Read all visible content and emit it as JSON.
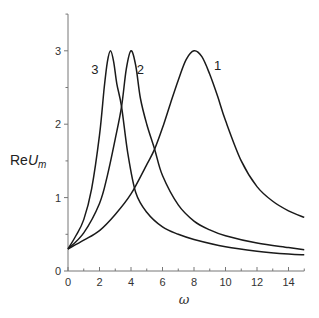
{
  "chart_data": {
    "type": "line",
    "title": "",
    "xlabel": "ω",
    "ylabel": "ReU_m",
    "ylabel_parts": {
      "re": "Re",
      "u": "U",
      "sub": "m"
    },
    "xlim": [
      0,
      15
    ],
    "ylim": [
      0,
      3.5
    ],
    "xticks": [
      0,
      2,
      4,
      6,
      8,
      10,
      12,
      14
    ],
    "xticks_minor": [
      1,
      3,
      5,
      7,
      9,
      11,
      13,
      15
    ],
    "yticks": [
      0,
      1,
      2,
      3
    ],
    "yticks_minor": [
      0.5,
      1.5,
      2.5,
      3.5
    ],
    "grid": false,
    "legend": "none (curves labeled inline)",
    "series": [
      {
        "name": "1",
        "label_pos": [
          9.5,
          2.8
        ],
        "x": [
          0,
          1,
          2,
          3,
          4,
          5,
          5.5,
          6,
          6.5,
          7,
          7.5,
          8,
          8.5,
          9,
          9.5,
          10,
          11,
          12,
          13,
          14,
          15
        ],
        "y": [
          0.3,
          0.42,
          0.55,
          0.77,
          1.05,
          1.45,
          1.66,
          1.95,
          2.28,
          2.6,
          2.88,
          3.0,
          2.92,
          2.68,
          2.38,
          2.05,
          1.5,
          1.15,
          0.95,
          0.82,
          0.73
        ]
      },
      {
        "name": "2",
        "label_pos": [
          4.6,
          2.75
        ],
        "x": [
          0,
          1,
          2,
          2.5,
          3,
          3.4,
          3.7,
          4,
          4.3,
          4.6,
          5,
          5.5,
          6,
          7,
          8,
          9,
          10,
          12,
          14,
          15
        ],
        "y": [
          0.3,
          0.52,
          0.92,
          1.3,
          1.8,
          2.24,
          2.75,
          3.0,
          2.8,
          2.35,
          2.0,
          1.66,
          1.3,
          0.9,
          0.68,
          0.56,
          0.48,
          0.38,
          0.32,
          0.29
        ]
      },
      {
        "name": "3",
        "label_pos": [
          1.7,
          2.75
        ],
        "x": [
          0,
          0.5,
          1,
          1.5,
          2,
          2.3,
          2.5,
          2.7,
          2.9,
          3.1,
          3.4,
          3.8,
          4.3,
          5,
          6,
          7,
          8,
          10,
          12,
          14,
          15
        ],
        "y": [
          0.3,
          0.48,
          0.7,
          1.12,
          1.85,
          2.5,
          2.85,
          3.0,
          2.85,
          2.55,
          2.24,
          1.6,
          1.07,
          0.8,
          0.6,
          0.5,
          0.43,
          0.33,
          0.27,
          0.23,
          0.22
        ]
      }
    ]
  },
  "layout": {
    "origin_px": [
      68,
      271
    ],
    "px_per_x": 15.75,
    "px_per_y": 73.4
  }
}
